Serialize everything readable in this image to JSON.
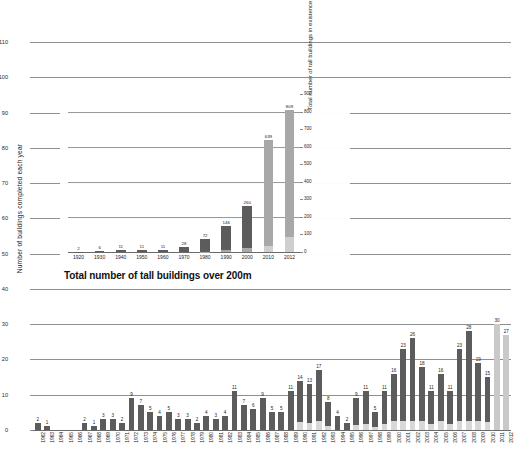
{
  "chart_data": [
    {
      "id": "main",
      "type": "bar",
      "title": "",
      "xlabel": "",
      "ylabel": "Number of buildings completed each year",
      "ylim": [
        0,
        110
      ],
      "yticks": [
        0,
        10,
        20,
        30,
        40,
        50,
        60,
        70,
        80,
        90,
        100,
        110
      ],
      "grid": true,
      "legend": "none",
      "stacked": true,
      "categories": [
        "1962",
        "1963",
        "1964",
        "1965",
        "1966",
        "1967",
        "1968",
        "1969",
        "1970",
        "1971",
        "1972",
        "1973",
        "1974",
        "1975",
        "1976",
        "1977",
        "1978",
        "1979",
        "1980",
        "1981",
        "1982",
        "1983",
        "1984",
        "1985",
        "1986",
        "1987",
        "1988",
        "1989",
        "1990",
        "1991",
        "1992",
        "1993",
        "1994",
        "1995",
        "1996",
        "1997",
        "1998",
        "1999",
        "2000",
        "2001",
        "2002",
        "2003",
        "2004",
        "2005",
        "2006",
        "2007",
        "2008",
        "2009",
        "2010",
        "2011",
        "2012"
      ],
      "values": [
        2,
        1,
        0,
        0,
        0,
        2,
        1,
        3,
        3,
        2,
        9,
        7,
        5,
        4,
        5,
        3,
        3,
        2,
        4,
        3,
        4,
        11,
        7,
        6,
        9,
        5,
        5,
        11,
        14,
        13,
        17,
        8,
        4,
        2,
        9,
        11,
        5,
        11,
        16,
        23,
        26,
        18,
        11,
        16,
        11,
        23,
        28,
        19,
        15,
        30,
        27,
        34,
        48,
        47,
        106,
        120
      ],
      "values_note": "values array is the total bar height per year; see series below for the authoritative per-year totals",
      "series": [
        {
          "name": "completed",
          "color": "#5c5c5c",
          "values": [
            2,
            1,
            0,
            0,
            0,
            2,
            1,
            3,
            3,
            2,
            9,
            7,
            5,
            4,
            5,
            3,
            3,
            2,
            4,
            3,
            4,
            11,
            7,
            6,
            9,
            5,
            5,
            11,
            14,
            13,
            17,
            8,
            4,
            2,
            9,
            11,
            5,
            11,
            16,
            23,
            26,
            18,
            11,
            16,
            11,
            23,
            28,
            19,
            15,
            30,
            27,
            34,
            48,
            47,
            106,
            120
          ]
        }
      ],
      "bar_labels": [
        2,
        1,
        null,
        null,
        null,
        2,
        1,
        3,
        3,
        2,
        9,
        7,
        5,
        4,
        5,
        3,
        3,
        2,
        4,
        3,
        4,
        11,
        7,
        6,
        9,
        5,
        5,
        11,
        14,
        13,
        17,
        8,
        4,
        2,
        9,
        11,
        5,
        11,
        16,
        23,
        26,
        18,
        11,
        16,
        11,
        23,
        28,
        19,
        15,
        30,
        27,
        34,
        48,
        47,
        106,
        120
      ],
      "projected_years": [
        "2011",
        "2012"
      ],
      "projected_color": "#c9c9c9"
    },
    {
      "id": "inset",
      "type": "bar",
      "title": "Total number of tall buildings over 200m",
      "xlabel": "",
      "ylabel": "Total number of tall buildings in existence",
      "ylim": [
        0,
        900
      ],
      "yticks": [
        0,
        100,
        200,
        300,
        400,
        500,
        600,
        700,
        800,
        900
      ],
      "grid": true,
      "stacked": true,
      "categories": [
        "1920",
        "1930",
        "1940",
        "1950",
        "1960",
        "1970",
        "1980",
        "1990",
        "2000",
        "2010",
        "2012"
      ],
      "values": [
        2,
        6,
        11,
        11,
        11,
        28,
        72,
        146,
        260,
        639,
        809
      ],
      "bar_labels": [
        2,
        6,
        11,
        11,
        11,
        28,
        72,
        146,
        260,
        639,
        809
      ],
      "base_segment_labels": [
        null,
        null,
        null,
        null,
        null,
        null,
        2,
        11,
        24,
        34,
        88
      ],
      "colors": {
        "top": "#a8a8a8",
        "dark": "#5c5c5c",
        "base": "#cfcfcf"
      }
    }
  ],
  "main": {
    "ylabel": "Number of buildings completed each year",
    "yticks": [
      "0",
      "10",
      "20",
      "30",
      "40",
      "50",
      "60",
      "70",
      "80",
      "90",
      "100",
      "110"
    ],
    "years": [
      "1962",
      "1963",
      "1964",
      "1965",
      "1966",
      "1967",
      "1968",
      "1969",
      "1970",
      "1971",
      "1972",
      "1973",
      "1974",
      "1975",
      "1976",
      "1977",
      "1978",
      "1979",
      "1980",
      "1981",
      "1982",
      "1983",
      "1984",
      "1985",
      "1986",
      "1987",
      "1988",
      "1989",
      "1990",
      "1991",
      "1992",
      "1993",
      "1994",
      "1995",
      "1996",
      "1997",
      "1998",
      "1999",
      "2000",
      "2001",
      "2002",
      "2003",
      "2004",
      "2005",
      "2006",
      "2007",
      "2008",
      "2009",
      "2010",
      "2011",
      "2012"
    ]
  },
  "inset": {
    "title": "Total number of tall buildings over 200m",
    "ylabel_right": "Total number of tall buildings in existence",
    "yticks": [
      "0",
      "100",
      "200",
      "300",
      "400",
      "500",
      "600",
      "700",
      "800",
      "900"
    ],
    "years": [
      "1920",
      "1930",
      "1940",
      "1950",
      "1960",
      "1970",
      "1980",
      "1990",
      "2000",
      "2010",
      "2012"
    ]
  }
}
